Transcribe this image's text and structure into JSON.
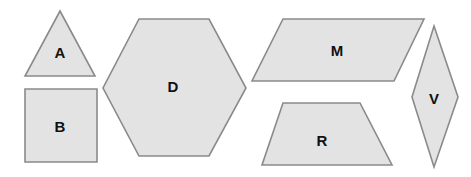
{
  "canvas": {
    "width": 471,
    "height": 177,
    "background": "#ffffff"
  },
  "style": {
    "fill": "#e3e3e3",
    "stroke": "#8a8a8a",
    "stroke_width": 1.6,
    "label_color": "#111111",
    "label_font_size": 15
  },
  "chart_data": {
    "type": "diagram",
    "title": "",
    "shape_count": 6,
    "shapes": [
      {
        "id": "shape-a",
        "label": "A",
        "kind": "triangle",
        "sides": 3,
        "points": "60,11 95,76 25,76",
        "label_x": 60,
        "label_y": 54,
        "bbox": [
          25,
          11,
          70,
          65
        ]
      },
      {
        "id": "shape-b",
        "label": "B",
        "kind": "square",
        "sides": 4,
        "points": "25,89 97,89 97,162 25,162",
        "label_x": 60,
        "label_y": 128,
        "bbox": [
          25,
          89,
          72,
          73
        ]
      },
      {
        "id": "shape-d",
        "label": "D",
        "kind": "hexagon",
        "sides": 6,
        "points": "139,19 209,19 246,88 209,156 139,156 103,88",
        "label_x": 173,
        "label_y": 88,
        "bbox": [
          103,
          19,
          143,
          137
        ]
      },
      {
        "id": "shape-m",
        "label": "M",
        "kind": "parallelogram",
        "sides": 4,
        "points": "283,19 424,19 394,81 252,81",
        "label_x": 337,
        "label_y": 52,
        "bbox": [
          252,
          19,
          172,
          62
        ]
      },
      {
        "id": "shape-r",
        "label": "R",
        "kind": "trapezoid",
        "sides": 4,
        "points": "283,103 360,103 392,165 262,165",
        "label_x": 322,
        "label_y": 142,
        "bbox": [
          262,
          103,
          130,
          62
        ]
      },
      {
        "id": "shape-v",
        "label": "V",
        "kind": "rhombus",
        "sides": 4,
        "points": "434,26 458,97 434,167 412,97",
        "label_x": 434,
        "label_y": 100,
        "bbox": [
          412,
          26,
          46,
          141
        ]
      }
    ]
  }
}
